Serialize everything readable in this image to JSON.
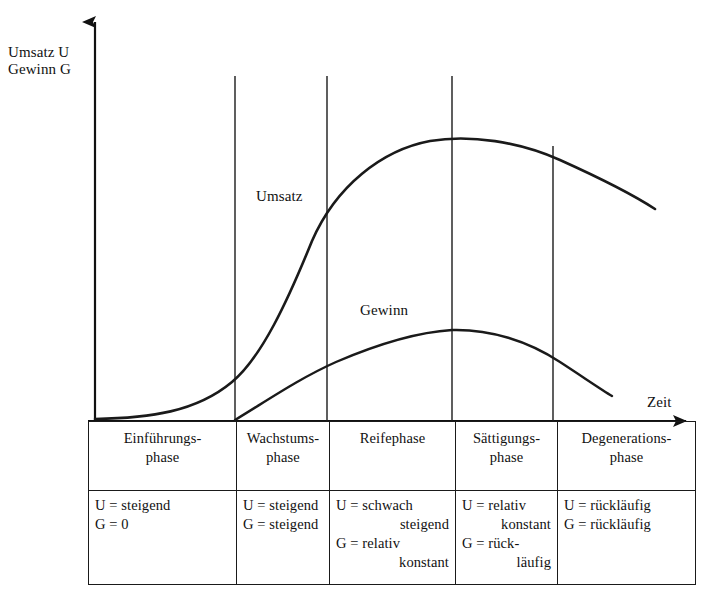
{
  "axes": {
    "y_label_line1": "Umsatz U",
    "y_label_line2": "Gewinn G",
    "x_label": "Zeit"
  },
  "curves": {
    "umsatz_label": "Umsatz",
    "gewinn_label": "Gewinn",
    "stroke_color": "#1a1a1a"
  },
  "phases": [
    {
      "head_line1": "Einführungs-",
      "head_line2": "phase",
      "body": [
        {
          "text": "U = steigend",
          "cont": false
        },
        {
          "text": "G = 0",
          "cont": false
        }
      ]
    },
    {
      "head_line1": "Wachstums-",
      "head_line2": "phase",
      "body": [
        {
          "text": "U = steigend",
          "cont": false
        },
        {
          "text": "G = steigend",
          "cont": false
        }
      ]
    },
    {
      "head_line1": "Reifephase",
      "head_line2": "",
      "body": [
        {
          "text": "U = schwach",
          "cont": false
        },
        {
          "text": "steigend",
          "cont": true
        },
        {
          "text": "G = relativ",
          "cont": false
        },
        {
          "text": "konstant",
          "cont": true
        }
      ]
    },
    {
      "head_line1": "Sättigungs-",
      "head_line2": "phase",
      "body": [
        {
          "text": "U = relativ",
          "cont": false
        },
        {
          "text": "konstant",
          "cont": true
        },
        {
          "text": "G = rück-",
          "cont": false
        },
        {
          "text": "läufig",
          "cont": true
        }
      ]
    },
    {
      "head_line1": "Degenerations-",
      "head_line2": "phase",
      "body": [
        {
          "text": "U = rückläufig",
          "cont": false
        },
        {
          "text": "G = rückläufig",
          "cont": false
        }
      ]
    }
  ],
  "chart_data": {
    "type": "line",
    "title": "",
    "xlabel": "Zeit",
    "ylabel": "Umsatz U / Gewinn G",
    "grid": false,
    "legend": "inline-curve-labels",
    "axis_ranges": {
      "x": [
        0,
        100
      ],
      "y": [
        0,
        100
      ]
    },
    "phase_boundaries_pct": [
      0,
      24.3,
      41.5,
      64.5,
      82.4,
      100
    ],
    "phase_names": [
      "Einführungsphase",
      "Wachstumsphase",
      "Reifephase",
      "Sättigungsphase",
      "Degenerationsphase"
    ],
    "series": [
      {
        "name": "Umsatz",
        "points_pct": [
          {
            "x": 0,
            "y": 0
          },
          {
            "x": 12,
            "y": 2
          },
          {
            "x": 24,
            "y": 10
          },
          {
            "x": 34,
            "y": 32
          },
          {
            "x": 41,
            "y": 51
          },
          {
            "x": 50,
            "y": 65
          },
          {
            "x": 58,
            "y": 76
          },
          {
            "x": 65,
            "y": 83
          },
          {
            "x": 72,
            "y": 87
          },
          {
            "x": 78,
            "y": 86
          },
          {
            "x": 86,
            "y": 80
          },
          {
            "x": 93,
            "y": 70
          },
          {
            "x": 100,
            "y": 57
          }
        ]
      },
      {
        "name": "Gewinn",
        "points_pct": [
          {
            "x": 24,
            "y": 0
          },
          {
            "x": 32,
            "y": 10
          },
          {
            "x": 41,
            "y": 20
          },
          {
            "x": 50,
            "y": 27
          },
          {
            "x": 58,
            "y": 31
          },
          {
            "x": 65,
            "y": 33
          },
          {
            "x": 72,
            "y": 32
          },
          {
            "x": 79,
            "y": 29
          },
          {
            "x": 86,
            "y": 23
          },
          {
            "x": 92,
            "y": 14
          },
          {
            "x": 95,
            "y": 8
          }
        ]
      }
    ]
  }
}
